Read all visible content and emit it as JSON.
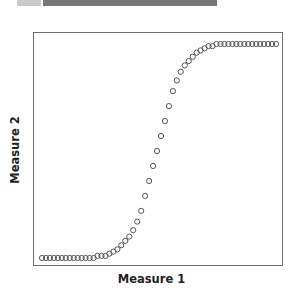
{
  "header": {
    "tab_color": "#c9c9c9",
    "bar_color": "#777777"
  },
  "chart_data": {
    "type": "scatter",
    "title": "",
    "xlabel": "Measure 1",
    "ylabel": "Measure 2",
    "grid": false,
    "legend": null,
    "marker": "open-circle",
    "marker_color": "#555555",
    "x_ticks": [],
    "y_ticks": [],
    "x": [
      1,
      2,
      3,
      4,
      5,
      6,
      7,
      8,
      9,
      10,
      11,
      12,
      13,
      14,
      15,
      16,
      17,
      18,
      19,
      20,
      21,
      22,
      23,
      24,
      25,
      26,
      27,
      28,
      29,
      30,
      31,
      32,
      33,
      34,
      35,
      36,
      37,
      38,
      39,
      40,
      41,
      42,
      43,
      44,
      45,
      46,
      47,
      48,
      49,
      50,
      51,
      52,
      53,
      54,
      55,
      56,
      57,
      58,
      59,
      60
    ],
    "y": [
      0.0,
      0.0,
      0.0,
      0.0,
      0.0,
      0.0,
      0.0,
      0.0,
      0.0,
      0.0,
      0.0,
      0.0,
      0.0,
      0.0,
      0.01,
      0.01,
      0.01,
      0.02,
      0.03,
      0.04,
      0.06,
      0.08,
      0.1,
      0.13,
      0.17,
      0.22,
      0.29,
      0.36,
      0.43,
      0.5,
      0.57,
      0.64,
      0.71,
      0.78,
      0.83,
      0.87,
      0.9,
      0.92,
      0.94,
      0.96,
      0.97,
      0.98,
      0.99,
      0.99,
      1.0,
      1.0,
      1.0,
      1.0,
      1.0,
      1.0,
      1.0,
      1.0,
      1.0,
      1.0,
      1.0,
      1.0,
      1.0,
      1.0,
      1.0,
      1.0
    ],
    "xlim": [
      0,
      61
    ],
    "ylim": [
      -0.04,
      1.04
    ]
  }
}
